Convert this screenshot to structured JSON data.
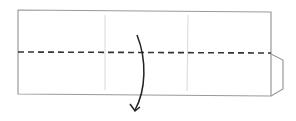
{
  "diagram": {
    "type": "origami-fold-step",
    "instruction": "valley fold along dashed line",
    "colors": {
      "paper_edge": "#9a9a9a",
      "crease": "#d6d6d6",
      "fold_line": "#333333",
      "arrow": "#222222",
      "background": "#ffffff"
    },
    "elements": {
      "paper": "rectangular strip",
      "creases": 2,
      "fold_line": "horizontal dashed",
      "flap": "right-side tab",
      "arrow": "curved downward fold arrow"
    }
  }
}
